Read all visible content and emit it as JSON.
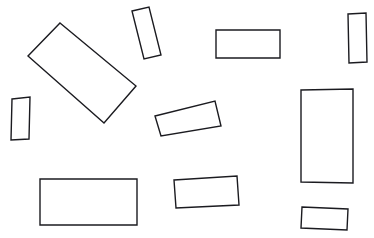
{
  "image": {
    "kind": "line-drawing",
    "title": "Scattered rectangles line drawing",
    "width": 374,
    "height": 238,
    "background_color": "#ffffff",
    "stroke_color": "#1b1b20",
    "fill_color": "#ffffff",
    "stroke_width": 1.4,
    "shape_count": 11,
    "shape_type": "rectangle"
  },
  "shapes": [
    {
      "id": "rect-1",
      "name": "large-rotated-rectangle-upper-left",
      "center_x": 82,
      "center_y": 73,
      "width": 99,
      "height": 49,
      "rotation_deg": 39.6,
      "points": "60,23 136,86 104,123 28,56"
    },
    {
      "id": "rect-2",
      "name": "tall-tilted-rectangle-top-center",
      "center_x": 146,
      "center_y": 33,
      "width": 18,
      "height": 49,
      "rotation_deg": -13,
      "points": "132,11 149,7 161,55 144,59"
    },
    {
      "id": "rect-3",
      "name": "wide-rectangle-top-right-of-center",
      "center_x": 248,
      "center_y": 44,
      "width": 64,
      "height": 29,
      "rotation_deg": 0,
      "points": "216,30 280,30 280,58 216,58"
    },
    {
      "id": "rect-4",
      "name": "tall-rectangle-top-right-corner",
      "center_x": 357,
      "center_y": 37,
      "width": 19,
      "height": 50,
      "rotation_deg": -3,
      "points": "348,14 366,13 367,62 349,63"
    },
    {
      "id": "rect-5",
      "name": "small-tall-rectangle-left-edge",
      "center_x": 20,
      "center_y": 119,
      "width": 19,
      "height": 42,
      "rotation_deg": -3,
      "points": "12,99 30,97 29,139 11,140"
    },
    {
      "id": "rect-6",
      "name": "tilted-rectangle-middle-center",
      "center_x": 188,
      "center_y": 121,
      "width": 62,
      "height": 26,
      "rotation_deg": -14,
      "points": "155,116 215,101 221,126 161,136"
    },
    {
      "id": "rect-7",
      "name": "tall-rectangle-right-middle",
      "center_x": 327,
      "center_y": 136,
      "width": 52,
      "height": 94,
      "rotation_deg": -1,
      "points": "301,90 353,89 353,183 301,182"
    },
    {
      "id": "rect-8",
      "name": "large-rectangle-bottom-left",
      "center_x": 88,
      "center_y": 202,
      "width": 97,
      "height": 46,
      "rotation_deg": 0,
      "points": "40,179 137,179 137,225 40,225"
    },
    {
      "id": "rect-9",
      "name": "rectangle-bottom-center",
      "center_x": 206,
      "center_y": 192,
      "width": 63,
      "height": 29,
      "rotation_deg": -3,
      "points": "174,180 237,176 239,205 176,208"
    },
    {
      "id": "rect-10",
      "name": "small-rectangle-bottom-right",
      "center_x": 325,
      "center_y": 218,
      "width": 46,
      "height": 22,
      "rotation_deg": 2,
      "points": "302,207 348,209 347,230 301,228"
    }
  ]
}
